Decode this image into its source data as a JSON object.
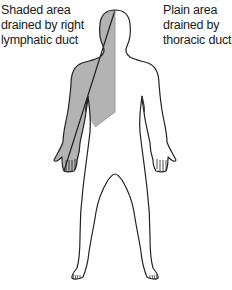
{
  "labels": {
    "shaded": {
      "lines": [
        "Shaded area",
        "drained by right",
        "lymphatic duct"
      ]
    },
    "plain": {
      "lines": [
        "Plain area",
        "drained by",
        "thoracic duct"
      ]
    }
  },
  "figure": {
    "shaded_region": "right side of head, neck, right arm and right upper chest",
    "shade_color": "#b3b3b3",
    "outline_color": "#222222",
    "background_color": "#ffffff"
  }
}
